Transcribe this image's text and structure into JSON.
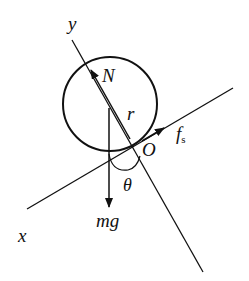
{
  "diagram": {
    "type": "free-body diagram",
    "object": "circle (wheel/sphere) on incline",
    "labels": {
      "y_axis": "y",
      "x_axis": "x",
      "normal_force": "N",
      "radius": "r",
      "friction_main": "f",
      "friction_sub": "s",
      "contact_point": "O",
      "angle": "θ",
      "gravity": "mg"
    },
    "colors": {
      "stroke": "#111111",
      "background": "#ffffff"
    }
  }
}
